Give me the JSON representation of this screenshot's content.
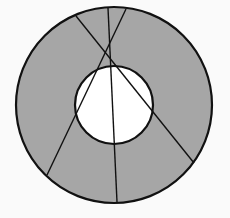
{
  "diagram": {
    "type": "annulus-with-chords",
    "colors": {
      "background": "#fafafa",
      "ring_fill": "#a6a6a6",
      "inner_fill": "#ffffff",
      "stroke": "#111111"
    },
    "outer_circle": {
      "cx": 114,
      "cy": 105,
      "r": 98
    },
    "inner_circle": {
      "cx": 114,
      "cy": 105,
      "r": 39
    },
    "lines": [
      {
        "x1": 76,
        "y1": 16,
        "x2": 194,
        "y2": 163
      },
      {
        "x1": 108,
        "y1": 8,
        "x2": 117,
        "y2": 202
      },
      {
        "x1": 126,
        "y1": 9,
        "x2": 47,
        "y2": 175
      }
    ]
  }
}
